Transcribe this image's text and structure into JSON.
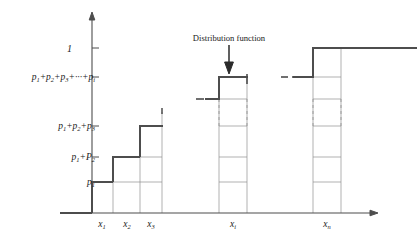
{
  "figure": {
    "title_annotation": "Distribution function",
    "axis": {
      "y_top_tick_label": "1",
      "x_axis_name": "x-axis",
      "y_axis_name": "y-axis"
    },
    "y_ticks": [
      {
        "id": "p1",
        "label_html": "p<sub>1</sub>",
        "value": 0.18
      },
      {
        "id": "p1p2",
        "label_html": "p<sub>1</sub>+P<sub>2</sub>",
        "value": 0.33
      },
      {
        "id": "p1p2p3",
        "label_html": "p<sub>1</sub>+p<sub>2</sub>+p<sub>3</sub>",
        "value": 0.52
      },
      {
        "id": "sum_i",
        "label_html": "p<sub>1</sub>+p<sub>2</sub>+p<sub>3</sub>+···+p<sub>i</sub>",
        "value": 0.78
      },
      {
        "id": "one",
        "label_html": "1",
        "value": 1.0
      }
    ],
    "x_ticks": [
      {
        "id": "x1",
        "label_html": "x<sub>1</sub>"
      },
      {
        "id": "x2",
        "label_html": "x<sub>2</sub>"
      },
      {
        "id": "x3",
        "label_html": "x<sub>3</sub>"
      },
      {
        "id": "xi",
        "label_html": "x<sub>i</sub>"
      },
      {
        "id": "xn",
        "label_html": "x<sub>n</sub>"
      }
    ],
    "colors": {
      "curve": "#4d4d4d",
      "grid": "#8c8c8c",
      "axis": "#4d4d4d",
      "text": "#1a1a1a",
      "dash": "#9a9a9a"
    }
  },
  "chart_data": {
    "type": "line",
    "title": "Distribution function",
    "xlabel": "",
    "ylabel": "",
    "grid": true,
    "legend": "none",
    "xlim": [
      0,
      1
    ],
    "ylim": [
      0,
      1.08
    ],
    "categories": [
      "x1",
      "x2",
      "x3",
      "xi",
      "xn"
    ],
    "category_labels": [
      "x₁",
      "x₂",
      "x₃",
      "xᵢ",
      "xₙ"
    ],
    "step_levels": [
      {
        "after": "x1",
        "cumulative_label": "p1",
        "value": 0.18
      },
      {
        "after": "x2",
        "cumulative_label": "p1+P2",
        "value": 0.33
      },
      {
        "after": "x3",
        "cumulative_label": "p1+p2+p3",
        "value": 0.52
      },
      {
        "after": "xi",
        "cumulative_label": "p1+p2+p3+...+pi",
        "value": 0.78
      },
      {
        "after": "xn",
        "cumulative_label": "1",
        "value": 1.0
      }
    ],
    "annotations": [
      {
        "text": "Distribution function",
        "points_to": "xi",
        "arrow": "down"
      }
    ],
    "breaks": [
      {
        "between": [
          "x3",
          "xi"
        ],
        "style": "dashed-ellipsis"
      },
      {
        "between": [
          "xi",
          "xn"
        ],
        "style": "dashed-ellipsis"
      }
    ]
  }
}
